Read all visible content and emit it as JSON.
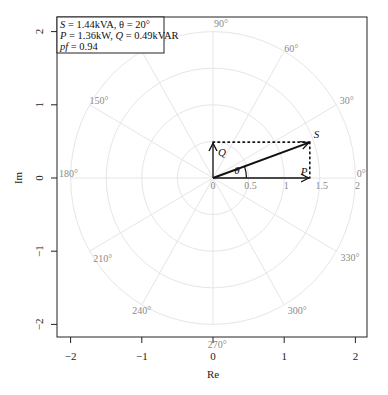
{
  "chart_data": {
    "type": "polar-phasor",
    "title": "",
    "xlabel": "Re",
    "ylabel": "Im",
    "xlim": [
      -2.2,
      2.2
    ],
    "ylim": [
      -2.2,
      2.2
    ],
    "x_ticks": [
      -2,
      -1,
      0,
      1,
      2
    ],
    "x_tick_labels": [
      "−2",
      "−1",
      "0",
      "1",
      "2"
    ],
    "y_ticks": [
      -2,
      -1,
      0,
      1,
      2
    ],
    "y_tick_labels": [
      "−2",
      "−1",
      "0",
      "1",
      "2"
    ],
    "grid": {
      "radii": [
        0.5,
        1,
        1.5,
        2
      ],
      "radius_labels": [
        "0",
        "0.5",
        "1",
        "1.5",
        "2"
      ],
      "angles_deg": [
        0,
        30,
        60,
        90,
        120,
        150,
        180,
        210,
        240,
        270,
        300,
        330
      ],
      "angle_labels": [
        "0°",
        "30°",
        "60°",
        "90°",
        "150°",
        "180°",
        "210°",
        "240°",
        "270°",
        "300°",
        "330°"
      ]
    },
    "vectors": [
      {
        "name": "P",
        "x": 1.36,
        "y": 0,
        "style": "solid"
      },
      {
        "name": "Q",
        "x": 0,
        "y": 0.49,
        "style": "solid"
      },
      {
        "name": "S",
        "x": 1.36,
        "y": 0.49,
        "style": "solid-bold"
      }
    ],
    "projections": [
      {
        "from": [
          0,
          0.49
        ],
        "to": [
          1.36,
          0.49
        ],
        "style": "dotted"
      },
      {
        "from": [
          1.36,
          0.49
        ],
        "to": [
          1.36,
          0
        ],
        "style": "dotted"
      }
    ],
    "angle_marker": {
      "label": "θ",
      "value_deg": 20
    },
    "legend": {
      "position": "top-left",
      "lines": [
        "S = 1.44kVA, θ = 20°",
        "P = 1.36kW, Q = 0.49kVAR",
        "pf = 0.94"
      ]
    },
    "values": {
      "S_kVA": 1.44,
      "theta_deg": 20,
      "P_kW": 1.36,
      "Q_kVAR": 0.49,
      "pf": 0.94
    }
  },
  "legend": {
    "line1_S": "S",
    "line1_rest": " = 1.44kVA, θ = 20°",
    "line2_P": "P",
    "line2_mid": " = 1.36kW, ",
    "line2_Q": "Q",
    "line2_rest": " = 0.49kVAR",
    "line3_pf": "pf",
    "line3_rest": " = 0.94"
  },
  "labels": {
    "S": "S",
    "P": "P",
    "Q": "Q",
    "theta": "θ",
    "xlabel": "Re",
    "ylabel": "Im"
  }
}
